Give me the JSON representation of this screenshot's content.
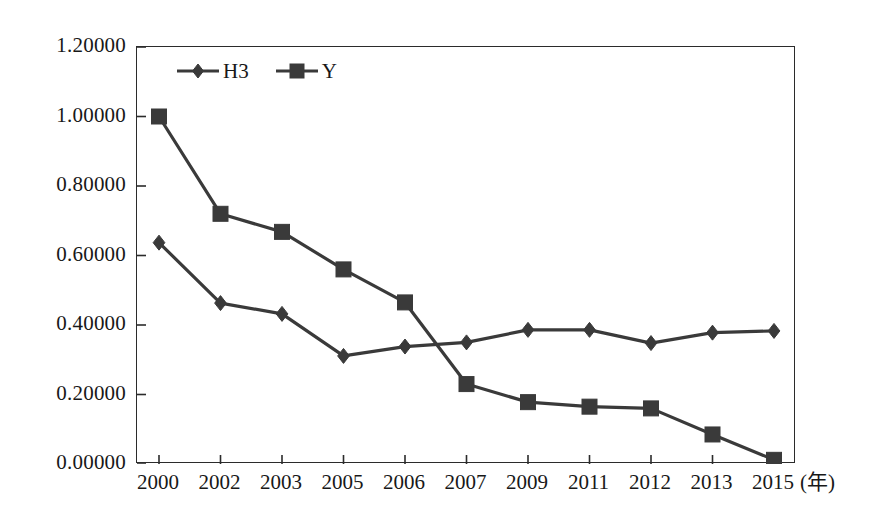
{
  "chart_data": {
    "type": "line",
    "title": "",
    "subtitle": "",
    "xlabel": "(年)",
    "ylabel": "",
    "x": [
      "2000",
      "2002",
      "2003",
      "2005",
      "2006",
      "2007",
      "2009",
      "2011",
      "2012",
      "2013",
      "2015"
    ],
    "categories": [
      "2000",
      "2002",
      "2003",
      "2005",
      "2006",
      "2007",
      "2009",
      "2011",
      "2012",
      "2013",
      "2015"
    ],
    "series": [
      {
        "name": "H3",
        "marker": "diamond",
        "values": [
          0.637,
          0.463,
          0.432,
          0.311,
          0.338,
          0.35,
          0.386,
          0.386,
          0.348,
          0.378,
          0.383
        ]
      },
      {
        "name": "Y",
        "marker": "square",
        "values": [
          1.0,
          0.72,
          0.668,
          0.56,
          0.465,
          0.23,
          0.178,
          0.165,
          0.16,
          0.085,
          0.012
        ]
      }
    ],
    "ylim": [
      0.0,
      1.2
    ],
    "ytick_values": [
      0.0,
      0.2,
      0.4,
      0.6,
      0.8,
      1.0,
      1.2
    ],
    "ytick_labels": [
      "0.00000",
      "0.20000",
      "0.40000",
      "0.60000",
      "0.80000",
      "1.00000",
      "1.20000"
    ],
    "xtick_labels": [
      "2000",
      "2002",
      "2003",
      "2005",
      "2006",
      "2007",
      "2009",
      "2011",
      "2012",
      "2013",
      "2015"
    ],
    "grid": false,
    "legend_position": "top-left-inside",
    "legend_entries": [
      "H3",
      "Y"
    ],
    "annotations": []
  },
  "style": {
    "series_color": "#3a3a3a",
    "axis_color": "#2b2b2b",
    "text_color": "#181818",
    "background": "#ffffff"
  }
}
